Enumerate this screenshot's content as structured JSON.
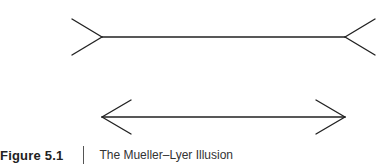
{
  "figure": {
    "label": "Figure 5.1",
    "title": "The Mueller–Lyer Illusion"
  },
  "diagram": {
    "type": "Mueller-Lyer illusion",
    "lines": [
      {
        "name": "fins-out-line",
        "y": 37,
        "x1": 102,
        "x2": 345,
        "fins": "outward"
      },
      {
        "name": "arrows-in-line",
        "y": 117,
        "x1": 102,
        "x2": 345,
        "fins": "inward"
      }
    ],
    "stroke_color": "#222222"
  }
}
